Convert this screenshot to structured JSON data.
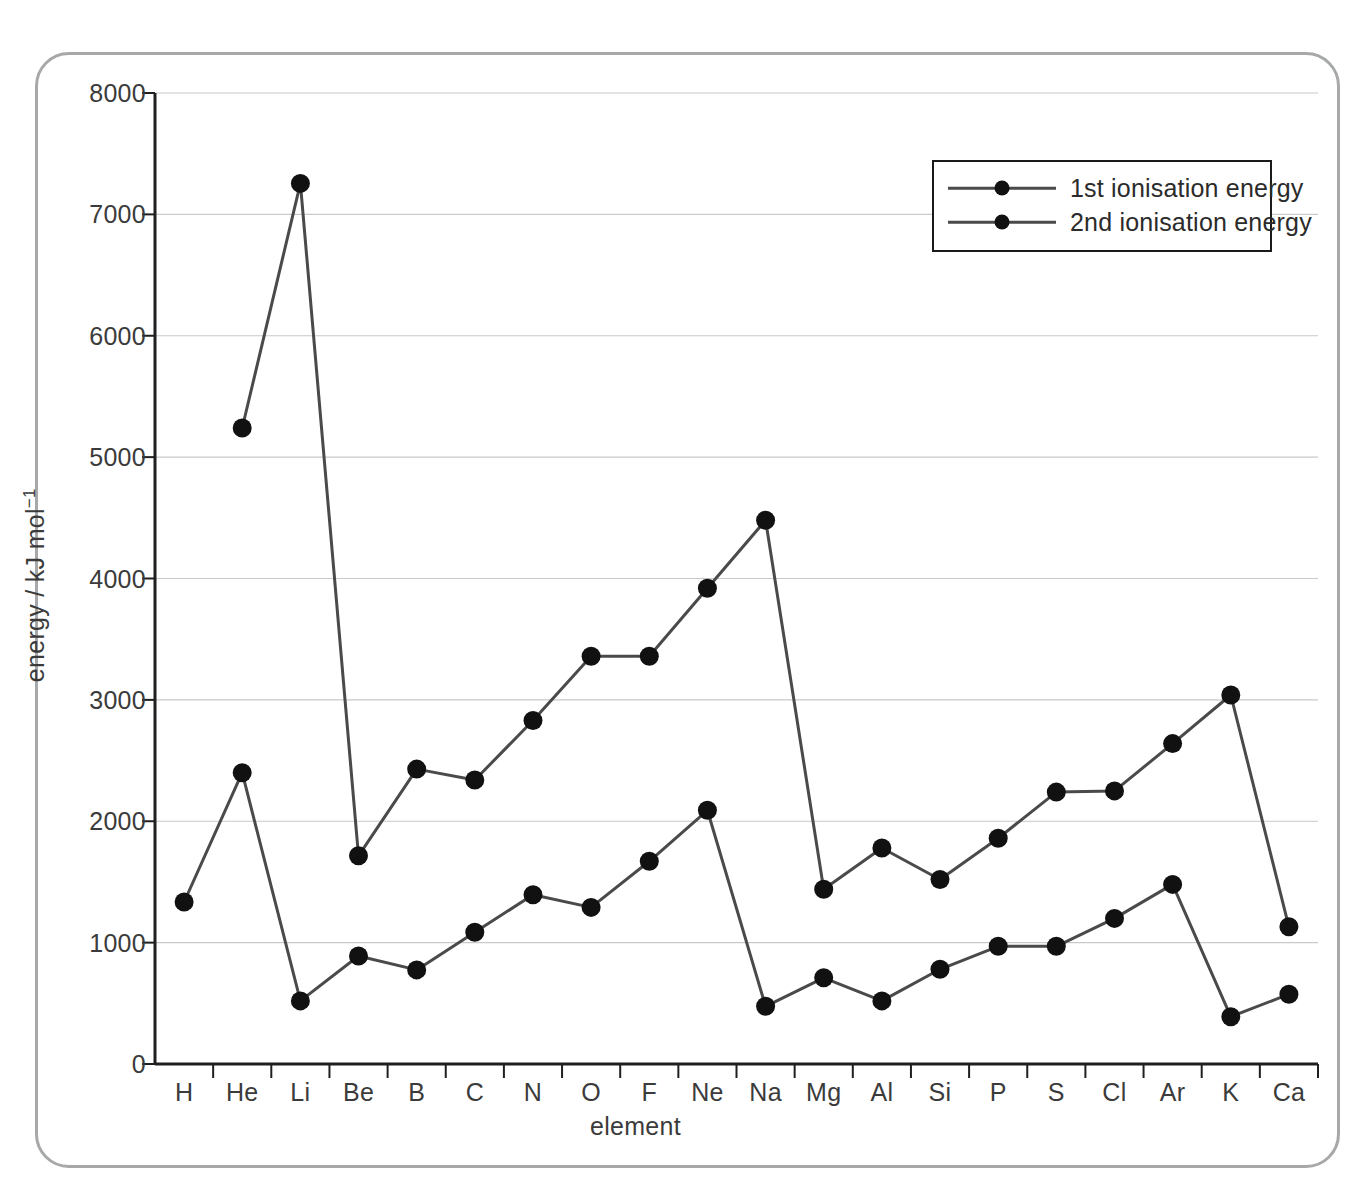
{
  "chart_data": {
    "type": "line",
    "title": "",
    "xlabel": "element",
    "ylabel": "energy / kJ mol⁻¹",
    "ylim": [
      0,
      8000
    ],
    "ytick_values": [
      0,
      1000,
      2000,
      3000,
      4000,
      5000,
      6000,
      7000,
      8000
    ],
    "ytick_labels": [
      "0",
      "1000",
      "2000",
      "3000",
      "4000",
      "5000",
      "6000",
      "7000",
      "8000"
    ],
    "grid": "horizontal",
    "legend_position": "top-right",
    "categories": [
      "H",
      "He",
      "Li",
      "Be",
      "B",
      "C",
      "N",
      "O",
      "F",
      "Ne",
      "Na",
      "Mg",
      "Al",
      "Si",
      "P",
      "S",
      "Cl",
      "Ar",
      "K",
      "Ca"
    ],
    "series": [
      {
        "name": "1st ionisation energy",
        "color": "#4a4a4a",
        "marker_color": "#111111",
        "values": [
          1335,
          2400,
          520,
          890,
          775,
          1085,
          1395,
          1290,
          1670,
          2090,
          475,
          710,
          520,
          780,
          970,
          970,
          1200,
          1480,
          390,
          575
        ]
      },
      {
        "name": "2nd ionisation energy",
        "color": "#4a4a4a",
        "marker_color": "#111111",
        "values": [
          null,
          5240,
          7255,
          1715,
          2430,
          2340,
          2830,
          3360,
          3360,
          3920,
          4480,
          1440,
          1780,
          1520,
          1860,
          2240,
          2250,
          2640,
          3040,
          1130
        ]
      }
    ]
  },
  "legend": {
    "items": [
      {
        "label": "1st ionisation energy"
      },
      {
        "label": "2nd ionisation energy"
      }
    ]
  },
  "axes": {
    "x_title": "element",
    "y_title_main": "energy / kJ mol",
    "y_title_exponent": "−1"
  }
}
